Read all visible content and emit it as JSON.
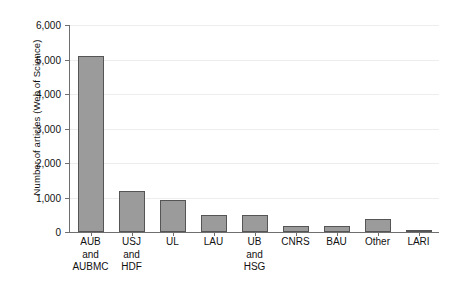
{
  "chart_data": {
    "type": "bar",
    "title": "",
    "xlabel": "",
    "ylabel": "Number of articles (Web of Science)",
    "categories": [
      "AUB and AUBMC",
      "USJ and HDF",
      "UL",
      "LAU",
      "UB and HSG",
      "CNRS",
      "BAU",
      "Other",
      "LARI"
    ],
    "category_lines": [
      [
        "AUB",
        "and",
        "AUBMC"
      ],
      [
        "USJ",
        "and",
        "HDF"
      ],
      [
        "UL"
      ],
      [
        "LAU"
      ],
      [
        "UB",
        "and",
        "HSG"
      ],
      [
        "CNRS"
      ],
      [
        "BAU"
      ],
      [
        "Other"
      ],
      [
        "LARI"
      ]
    ],
    "values": [
      5100,
      1200,
      920,
      480,
      500,
      160,
      180,
      380,
      40
    ],
    "ylim": [
      0,
      6000
    ],
    "yticks": [
      0,
      1000,
      2000,
      3000,
      4000,
      5000,
      6000
    ],
    "ytick_labels": [
      "0",
      "1,000",
      "2,000",
      "3,000",
      "4,000",
      "5,000",
      "6,000"
    ],
    "grid": true,
    "legend": null,
    "colors": {
      "bar_fill": "#9b9b9b",
      "bar_edge": "#555555",
      "axis": "#6f6f6f",
      "grid": "#ededed",
      "text": "#111111",
      "background": "#ffffff"
    }
  }
}
